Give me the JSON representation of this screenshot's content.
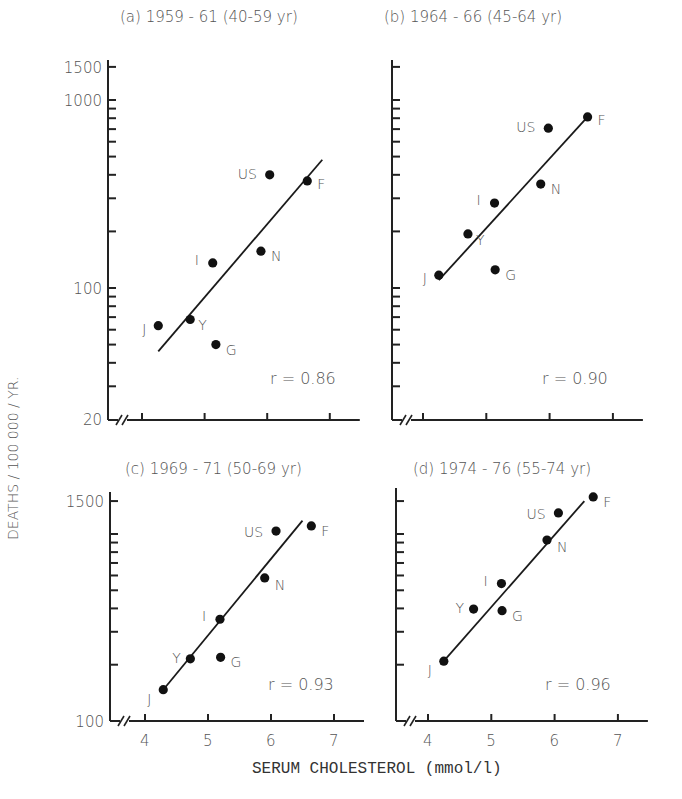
{
  "figure": {
    "y_axis_label": "DEATHS  /  100 000  /  YR.",
    "x_axis_label": "SERUM CHOLESTEROL   (mmol/l)",
    "x_tick_labels": [
      "4",
      "5",
      "6",
      "7"
    ]
  },
  "chart_data": [
    {
      "type": "scatter",
      "panel": "a",
      "title": "(a) 1959 - 61 (40-59 yr)",
      "xlabel": "SERUM CHOLESTEROL (mmol/l)",
      "ylabel": "DEATHS / 100 000 / YR.",
      "yscale": "log",
      "ylim": [
        20,
        1500
      ],
      "y_tick_labels": [
        "1500",
        "1000",
        "100",
        "20"
      ],
      "xlim": [
        3.75,
        7.4
      ],
      "x_ticks": [
        4,
        5,
        6,
        7
      ],
      "annotation": "r = 0.86",
      "points": [
        {
          "label": "J",
          "x": 4.26,
          "y": 63
        },
        {
          "label": "Y",
          "x": 4.77,
          "y": 68
        },
        {
          "label": "G",
          "x": 5.18,
          "y": 50
        },
        {
          "label": "I",
          "x": 5.13,
          "y": 136
        },
        {
          "label": "N",
          "x": 5.9,
          "y": 157
        },
        {
          "label": "US",
          "x": 6.04,
          "y": 400
        },
        {
          "label": "F",
          "x": 6.64,
          "y": 371
        }
      ],
      "fit_line": {
        "x": [
          4.26,
          6.88
        ],
        "y": [
          46,
          481
        ]
      }
    },
    {
      "type": "scatter",
      "panel": "b",
      "title": "(b) 1964 - 66 (45-64 yr)",
      "yscale": "log",
      "ylim": [
        20,
        1500
      ],
      "xlim": [
        3.75,
        7.4
      ],
      "x_ticks": [
        4,
        5,
        6,
        7
      ],
      "annotation": "r = 0.90",
      "points": [
        {
          "label": "J",
          "x": 4.25,
          "y": 117
        },
        {
          "label": "Y",
          "x": 4.71,
          "y": 194
        },
        {
          "label": "I",
          "x": 5.13,
          "y": 283
        },
        {
          "label": "G",
          "x": 5.14,
          "y": 125
        },
        {
          "label": "N",
          "x": 5.86,
          "y": 357
        },
        {
          "label": "US",
          "x": 5.98,
          "y": 708
        },
        {
          "label": "F",
          "x": 6.6,
          "y": 813
        }
      ],
      "fit_line": {
        "x": [
          4.25,
          6.6
        ],
        "y": [
          110,
          813
        ]
      }
    },
    {
      "type": "scatter",
      "panel": "c",
      "title": "(c) 1969 - 71 (50-69 yr)",
      "yscale": "log",
      "ylim": [
        100,
        1500
      ],
      "y_tick_labels": [
        "1500",
        "100"
      ],
      "xlim": [
        3.75,
        7.4
      ],
      "x_ticks": [
        4,
        5,
        6,
        7
      ],
      "annotation": "r = 0.93",
      "points": [
        {
          "label": "J",
          "x": 4.29,
          "y": 147
        },
        {
          "label": "Y",
          "x": 4.72,
          "y": 215
        },
        {
          "label": "G",
          "x": 5.2,
          "y": 219
        },
        {
          "label": "I",
          "x": 5.19,
          "y": 350
        },
        {
          "label": "N",
          "x": 5.9,
          "y": 582
        },
        {
          "label": "US",
          "x": 6.08,
          "y": 1037
        },
        {
          "label": "F",
          "x": 6.64,
          "y": 1104
        }
      ],
      "fit_line": {
        "x": [
          4.29,
          6.5
        ],
        "y": [
          147,
          1180
        ]
      }
    },
    {
      "type": "scatter",
      "panel": "d",
      "title": "(d) 1974 - 76 (55-74 yr)",
      "yscale": "log",
      "ylim": [
        100,
        1500
      ],
      "xlim": [
        3.75,
        7.4
      ],
      "x_ticks": [
        4,
        5,
        6,
        7
      ],
      "annotation": "r = 0.96",
      "points": [
        {
          "label": "J",
          "x": 4.25,
          "y": 209
        },
        {
          "label": "Y",
          "x": 4.72,
          "y": 397
        },
        {
          "label": "G",
          "x": 5.17,
          "y": 389
        },
        {
          "label": "I",
          "x": 5.16,
          "y": 543
        },
        {
          "label": "N",
          "x": 5.88,
          "y": 929
        },
        {
          "label": "US",
          "x": 6.06,
          "y": 1296
        },
        {
          "label": "F",
          "x": 6.61,
          "y": 1578
        }
      ],
      "fit_line": {
        "x": [
          4.2,
          6.47
        ],
        "y": [
          200,
          1500
        ]
      }
    }
  ]
}
